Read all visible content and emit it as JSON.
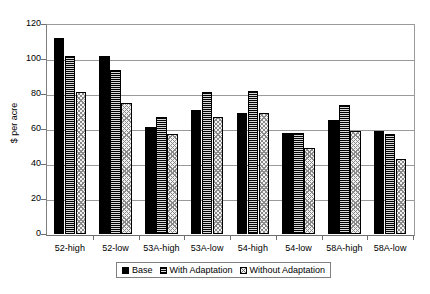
{
  "chart_data": {
    "type": "bar",
    "title": "",
    "xlabel": "",
    "ylabel": "$ per acre",
    "ylim": [
      0,
      120
    ],
    "yticks": [
      0,
      20,
      40,
      60,
      80,
      100,
      120
    ],
    "ytick_labels": [
      "0",
      "20",
      "40",
      "60",
      "80",
      "100",
      "120"
    ],
    "grid": true,
    "legend_position": "bottom",
    "categories": [
      "52-high",
      "52-low",
      "53A-high",
      "53A-low",
      "54-high",
      "54-low",
      "58A-high",
      "58A-low"
    ],
    "series": [
      {
        "name": "Base",
        "pattern": "solid-black",
        "values": [
          112,
          102,
          61,
          71,
          69,
          58,
          65,
          59
        ]
      },
      {
        "name": "With Adaptation",
        "pattern": "horizontal-stripes",
        "values": [
          102,
          94,
          67,
          81,
          82,
          58,
          74,
          57
        ]
      },
      {
        "name": "Without Adaptation",
        "pattern": "speckled-dots",
        "values": [
          81,
          75,
          57,
          67,
          69,
          49,
          59,
          43
        ]
      }
    ]
  },
  "legend": {
    "items": [
      {
        "label": "Base",
        "swatch": "solid-black"
      },
      {
        "label": "With Adaptation",
        "swatch": "horizontal-stripes"
      },
      {
        "label": "Without Adaptation",
        "swatch": "speckled-dots"
      }
    ]
  }
}
